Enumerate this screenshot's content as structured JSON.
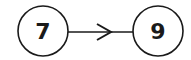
{
  "diagram": {
    "type": "directed-graph",
    "nodes": [
      {
        "id": "n1",
        "label": "7",
        "cx": 43,
        "cy": 31,
        "r": 25
      },
      {
        "id": "n2",
        "label": "9",
        "cx": 158,
        "cy": 31,
        "r": 25
      }
    ],
    "edges": [
      {
        "from": "n1",
        "to": "n2",
        "style": "arrow-midpoint"
      }
    ],
    "colors": {
      "stroke": "#1a1a1a",
      "background": "#ffffff"
    }
  }
}
